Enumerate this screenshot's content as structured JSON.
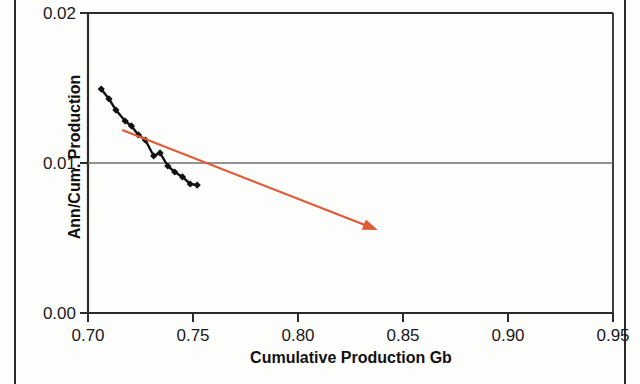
{
  "chart_data": {
    "type": "line",
    "title": "",
    "xlabel": "Cumulative Production Gb",
    "ylabel": "Ann/Cum. Production",
    "xlim": [
      0.7,
      0.95
    ],
    "ylim": [
      0.0,
      0.02
    ],
    "xticks": [
      "0.70",
      "0.75",
      "0.80",
      "0.85",
      "0.90",
      "0.95"
    ],
    "yticks": [
      "0.00",
      "0.01",
      "0.02"
    ],
    "grid": "horizontal-at-0.01",
    "legend": "none",
    "series": [
      {
        "name": "Ann/Cum. Production",
        "style": "line-with-diamond-markers",
        "color": "#111111",
        "points": [
          {
            "x": 0.7063,
            "y": 0.01493
          },
          {
            "x": 0.71,
            "y": 0.01427
          },
          {
            "x": 0.7133,
            "y": 0.01353
          },
          {
            "x": 0.7177,
            "y": 0.0128
          },
          {
            "x": 0.7207,
            "y": 0.01247
          },
          {
            "x": 0.724,
            "y": 0.01187
          },
          {
            "x": 0.7273,
            "y": 0.01153
          },
          {
            "x": 0.7313,
            "y": 0.01047
          },
          {
            "x": 0.7343,
            "y": 0.01067
          },
          {
            "x": 0.738,
            "y": 0.0098
          },
          {
            "x": 0.7413,
            "y": 0.0094
          },
          {
            "x": 0.745,
            "y": 0.00907
          },
          {
            "x": 0.7487,
            "y": 0.0086
          },
          {
            "x": 0.752,
            "y": 0.00853
          }
        ]
      },
      {
        "name": "Trend line",
        "style": "straight-arrow",
        "color": "#e05a36",
        "start": {
          "x": 0.7163,
          "y": 0.0122
        },
        "end": {
          "x": 0.838,
          "y": 0.00553
        },
        "arrowhead": "end"
      }
    ]
  },
  "axes": {
    "y_ticks": [
      {
        "label": "0.02",
        "value": 0.02
      },
      {
        "label": "0.01",
        "value": 0.01
      },
      {
        "label": "0.00",
        "value": 0.0
      }
    ],
    "x_ticks": [
      {
        "label": "0.70",
        "value": 0.7
      },
      {
        "label": "0.75",
        "value": 0.75
      },
      {
        "label": "0.80",
        "value": 0.8
      },
      {
        "label": "0.85",
        "value": 0.85
      },
      {
        "label": "0.90",
        "value": 0.9
      },
      {
        "label": "0.95",
        "value": 0.95
      }
    ],
    "x_title": "Cumulative Production Gb",
    "y_title": "Ann/Cum. Production"
  },
  "colors": {
    "axis": "#2b2b2b",
    "grid": "#6e6e6e",
    "data_line": "#111111",
    "trend_line": "#e05a36",
    "background": "#fdfdfc"
  }
}
